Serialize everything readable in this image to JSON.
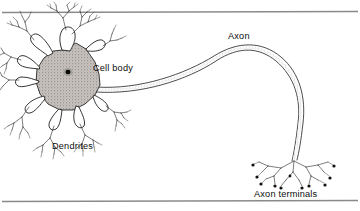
{
  "figure": {
    "type": "labeled-biological-diagram",
    "background_color": "#ffffff",
    "ink_color": "#111111",
    "rule_color": "#8a8a8a",
    "soma_fill_color": "#b5b0ab",
    "width": 360,
    "height": 211
  },
  "rules": {
    "top_rule": "horizontal-rule",
    "bottom_rule": "horizontal-rule"
  },
  "labels": {
    "cell_body": "Cell body",
    "dendrites": "Dendrites",
    "axon": "Axon",
    "axon_terminals": "Axon terminals"
  },
  "parts": {
    "soma": "cell-body-soma",
    "nucleus": "nucleus",
    "dendrite_tree": "dendrite-tree",
    "axon": "axon-fiber",
    "axon_terminal_tree": "axon-terminal-tree",
    "terminal_boutons": "terminal-boutons"
  }
}
